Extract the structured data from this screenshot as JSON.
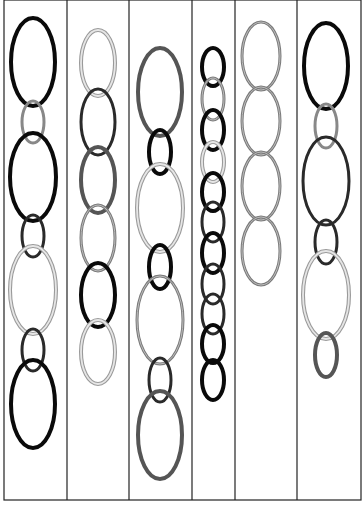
{
  "canvas": {
    "width": 364,
    "height": 507,
    "background": "#ffffff"
  },
  "frame": {
    "left": 4,
    "top": 0,
    "right": 361,
    "bottom": 500,
    "stroke": "#222222"
  },
  "dividers": [
    67,
    129,
    192,
    235,
    297
  ],
  "styles": {
    "black": {
      "stroke": "#0a0a0a",
      "width": 4,
      "double": false
    },
    "dark": {
      "stroke": "#2a2a2a",
      "width": 3,
      "double": false
    },
    "darkgray": {
      "stroke": "#555555",
      "width": 4,
      "double": false
    },
    "gray": {
      "stroke": "#7a7a7a",
      "width": 3,
      "double": true,
      "inner": "#bdbdbd"
    },
    "light": {
      "stroke": "#9a9a9a",
      "width": 4,
      "double": true,
      "inner": "#e6e6e6"
    },
    "midgray": {
      "stroke": "#888888",
      "width": 3,
      "double": false
    }
  },
  "columns": [
    {
      "name": "column-1",
      "ovals": [
        {
          "cx": 33,
          "cy": 62,
          "rx": 22,
          "ry": 44,
          "style": "black"
        },
        {
          "cx": 33,
          "cy": 122,
          "rx": 11,
          "ry": 21,
          "style": "midgray"
        },
        {
          "cx": 33,
          "cy": 177,
          "rx": 23,
          "ry": 44,
          "style": "black"
        },
        {
          "cx": 33,
          "cy": 236,
          "rx": 11,
          "ry": 21,
          "style": "dark"
        },
        {
          "cx": 33,
          "cy": 290,
          "rx": 23,
          "ry": 44,
          "style": "light"
        },
        {
          "cx": 33,
          "cy": 350,
          "rx": 11,
          "ry": 21,
          "style": "dark"
        },
        {
          "cx": 33,
          "cy": 404,
          "rx": 22,
          "ry": 44,
          "style": "black"
        }
      ]
    },
    {
      "name": "column-2",
      "ovals": [
        {
          "cx": 98,
          "cy": 63,
          "rx": 17,
          "ry": 33,
          "style": "light"
        },
        {
          "cx": 98,
          "cy": 122,
          "rx": 17,
          "ry": 33,
          "style": "dark"
        },
        {
          "cx": 98,
          "cy": 180,
          "rx": 17,
          "ry": 33,
          "style": "darkgray"
        },
        {
          "cx": 98,
          "cy": 238,
          "rx": 17,
          "ry": 33,
          "style": "gray"
        },
        {
          "cx": 98,
          "cy": 295,
          "rx": 17,
          "ry": 32,
          "style": "black"
        },
        {
          "cx": 98,
          "cy": 352,
          "rx": 17,
          "ry": 32,
          "style": "light"
        }
      ]
    },
    {
      "name": "column-3",
      "ovals": [
        {
          "cx": 160,
          "cy": 92,
          "rx": 22,
          "ry": 44,
          "style": "darkgray"
        },
        {
          "cx": 160,
          "cy": 152,
          "rx": 11,
          "ry": 22,
          "style": "black"
        },
        {
          "cx": 160,
          "cy": 208,
          "rx": 23,
          "ry": 44,
          "style": "light"
        },
        {
          "cx": 160,
          "cy": 267,
          "rx": 11,
          "ry": 22,
          "style": "black"
        },
        {
          "cx": 160,
          "cy": 320,
          "rx": 23,
          "ry": 44,
          "style": "gray"
        },
        {
          "cx": 160,
          "cy": 380,
          "rx": 11,
          "ry": 22,
          "style": "dark"
        },
        {
          "cx": 160,
          "cy": 435,
          "rx": 22,
          "ry": 44,
          "style": "darkgray"
        }
      ]
    },
    {
      "name": "column-4",
      "ovals": [
        {
          "cx": 213,
          "cy": 67,
          "rx": 11,
          "ry": 19,
          "style": "black"
        },
        {
          "cx": 213,
          "cy": 99,
          "rx": 11,
          "ry": 21,
          "style": "gray"
        },
        {
          "cx": 213,
          "cy": 130,
          "rx": 11,
          "ry": 20,
          "style": "black"
        },
        {
          "cx": 213,
          "cy": 162,
          "rx": 11,
          "ry": 20,
          "style": "light"
        },
        {
          "cx": 213,
          "cy": 192,
          "rx": 11,
          "ry": 19,
          "style": "black"
        },
        {
          "cx": 213,
          "cy": 222,
          "rx": 11,
          "ry": 20,
          "style": "dark"
        },
        {
          "cx": 213,
          "cy": 253,
          "rx": 11,
          "ry": 20,
          "style": "black"
        },
        {
          "cx": 213,
          "cy": 284,
          "rx": 11,
          "ry": 20,
          "style": "dark"
        },
        {
          "cx": 213,
          "cy": 314,
          "rx": 11,
          "ry": 20,
          "style": "dark"
        },
        {
          "cx": 213,
          "cy": 344,
          "rx": 11,
          "ry": 19,
          "style": "black"
        },
        {
          "cx": 213,
          "cy": 350,
          "rx": 0,
          "ry": 0,
          "style": "black"
        },
        {
          "cx": 213,
          "cy": 380,
          "rx": 11,
          "ry": 20,
          "style": "black"
        }
      ]
    },
    {
      "name": "column-5",
      "ovals": [
        {
          "cx": 261,
          "cy": 56,
          "rx": 19,
          "ry": 34,
          "style": "gray"
        },
        {
          "cx": 261,
          "cy": 121,
          "rx": 19,
          "ry": 34,
          "style": "gray"
        },
        {
          "cx": 261,
          "cy": 186,
          "rx": 19,
          "ry": 34,
          "style": "gray"
        },
        {
          "cx": 261,
          "cy": 251,
          "rx": 19,
          "ry": 34,
          "style": "gray"
        }
      ]
    },
    {
      "name": "column-6",
      "ovals": [
        {
          "cx": 326,
          "cy": 66,
          "rx": 22,
          "ry": 43,
          "style": "black"
        },
        {
          "cx": 326,
          "cy": 126,
          "rx": 11,
          "ry": 22,
          "style": "midgray"
        },
        {
          "cx": 326,
          "cy": 181,
          "rx": 23,
          "ry": 44,
          "style": "dark"
        },
        {
          "cx": 326,
          "cy": 242,
          "rx": 11,
          "ry": 22,
          "style": "dark"
        },
        {
          "cx": 326,
          "cy": 295,
          "rx": 23,
          "ry": 44,
          "style": "light"
        },
        {
          "cx": 326,
          "cy": 355,
          "rx": 11,
          "ry": 22,
          "style": "darkgray"
        }
      ]
    }
  ]
}
